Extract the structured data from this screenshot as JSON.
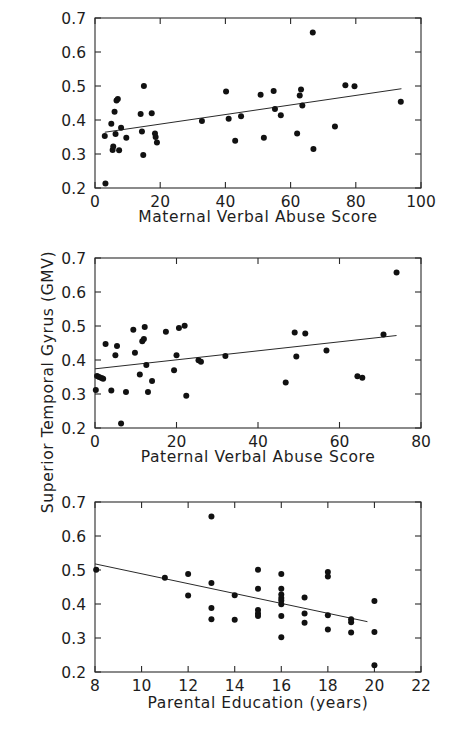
{
  "figure": {
    "y_axis_title": "Superior Temporal Gyrus (GMV)",
    "background_color": "#ffffff",
    "point_color": "#111111",
    "line_color": "#2a2a2a"
  },
  "chart_data": [
    {
      "type": "scatter",
      "panel": "top",
      "title": "",
      "xlabel": "Maternal Verbal Abuse Score",
      "ylabel": "Superior Temporal Gyrus (GMV)",
      "xlim": [
        0,
        100
      ],
      "ylim": [
        0.2,
        0.7
      ],
      "xticks": [
        0,
        20,
        40,
        60,
        80,
        100
      ],
      "xtick_labels": [
        "0",
        "20",
        "40",
        "60",
        "80",
        "100"
      ],
      "yticks": [
        0.2,
        0.3,
        0.4,
        0.5,
        0.6,
        0.7
      ],
      "ytick_labels": [
        "0.2",
        "0.3",
        "0.4",
        "0.5",
        "0.6",
        "0.7"
      ],
      "grid": false,
      "legend": false,
      "points": [
        [
          3.0,
          0.353
        ],
        [
          3.2,
          0.213
        ],
        [
          5.0,
          0.389
        ],
        [
          5.4,
          0.312
        ],
        [
          5.6,
          0.322
        ],
        [
          6.0,
          0.424
        ],
        [
          6.3,
          0.359
        ],
        [
          6.6,
          0.457
        ],
        [
          7.0,
          0.462
        ],
        [
          7.4,
          0.311
        ],
        [
          8.0,
          0.377
        ],
        [
          9.6,
          0.348
        ],
        [
          14.0,
          0.418
        ],
        [
          14.4,
          0.366
        ],
        [
          14.8,
          0.297
        ],
        [
          15.0,
          0.5
        ],
        [
          17.4,
          0.42
        ],
        [
          18.4,
          0.36
        ],
        [
          18.6,
          0.35
        ],
        [
          19.0,
          0.334
        ],
        [
          32.8,
          0.397
        ],
        [
          40.2,
          0.484
        ],
        [
          41.0,
          0.404
        ],
        [
          43.0,
          0.339
        ],
        [
          44.8,
          0.411
        ],
        [
          50.8,
          0.474
        ],
        [
          51.8,
          0.348
        ],
        [
          54.8,
          0.485
        ],
        [
          55.2,
          0.432
        ],
        [
          57.0,
          0.414
        ],
        [
          62.0,
          0.36
        ],
        [
          62.8,
          0.472
        ],
        [
          63.2,
          0.49
        ],
        [
          63.6,
          0.443
        ],
        [
          66.8,
          0.657
        ],
        [
          67.0,
          0.315
        ],
        [
          73.6,
          0.381
        ],
        [
          76.8,
          0.502
        ],
        [
          79.6,
          0.499
        ],
        [
          93.8,
          0.454
        ]
      ],
      "fit_line": {
        "x": [
          3.0,
          94.0
        ],
        "y": [
          0.364,
          0.492
        ]
      }
    },
    {
      "type": "scatter",
      "panel": "middle",
      "title": "",
      "xlabel": "Paternal Verbal Abuse Score",
      "ylabel": "Superior Temporal Gyrus (GMV)",
      "xlim": [
        0,
        80
      ],
      "ylim": [
        0.2,
        0.7
      ],
      "xticks": [
        0,
        20,
        40,
        60,
        80
      ],
      "xtick_labels": [
        "0",
        "20",
        "40",
        "60",
        "80"
      ],
      "yticks": [
        0.2,
        0.3,
        0.4,
        0.5,
        0.6,
        0.7
      ],
      "ytick_labels": [
        "0.2",
        "0.3",
        "0.4",
        "0.5",
        "0.6",
        "0.7"
      ],
      "grid": false,
      "legend": false,
      "points": [
        [
          0.2,
          0.312
        ],
        [
          0.5,
          0.353
        ],
        [
          1.0,
          0.35
        ],
        [
          1.6,
          0.347
        ],
        [
          2.0,
          0.345
        ],
        [
          2.6,
          0.447
        ],
        [
          4.0,
          0.31
        ],
        [
          5.0,
          0.414
        ],
        [
          5.4,
          0.441
        ],
        [
          6.4,
          0.213
        ],
        [
          7.6,
          0.306
        ],
        [
          9.4,
          0.489
        ],
        [
          9.8,
          0.421
        ],
        [
          11.0,
          0.357
        ],
        [
          11.6,
          0.455
        ],
        [
          12.0,
          0.462
        ],
        [
          12.2,
          0.497
        ],
        [
          12.6,
          0.385
        ],
        [
          13.0,
          0.306
        ],
        [
          14.0,
          0.338
        ],
        [
          17.4,
          0.483
        ],
        [
          19.4,
          0.37
        ],
        [
          20.0,
          0.414
        ],
        [
          20.6,
          0.494
        ],
        [
          22.0,
          0.501
        ],
        [
          22.4,
          0.295
        ],
        [
          25.4,
          0.399
        ],
        [
          26.0,
          0.395
        ],
        [
          32.0,
          0.412
        ],
        [
          46.8,
          0.334
        ],
        [
          49.0,
          0.481
        ],
        [
          49.4,
          0.41
        ],
        [
          51.6,
          0.478
        ],
        [
          56.8,
          0.428
        ],
        [
          64.4,
          0.352
        ],
        [
          65.6,
          0.348
        ],
        [
          70.8,
          0.475
        ],
        [
          74.0,
          0.657
        ]
      ],
      "fit_line": {
        "x": [
          0.0,
          74.0
        ],
        "y": [
          0.374,
          0.472
        ]
      }
    },
    {
      "type": "scatter",
      "panel": "bottom",
      "title": "",
      "xlabel": "Parental Education (years)",
      "ylabel": "Superior Temporal Gyrus (GMV)",
      "xlim": [
        8,
        22
      ],
      "ylim": [
        0.2,
        0.7
      ],
      "xticks": [
        8,
        10,
        12,
        14,
        16,
        18,
        20,
        22
      ],
      "xtick_labels": [
        "8",
        "10",
        "12",
        "14",
        "16",
        "18",
        "20",
        "22"
      ],
      "yticks": [
        0.2,
        0.3,
        0.4,
        0.5,
        0.6,
        0.7
      ],
      "ytick_labels": [
        "0.2",
        "0.3",
        "0.4",
        "0.5",
        "0.6",
        "0.7"
      ],
      "grid": false,
      "legend": false,
      "points": [
        [
          8.05,
          0.501
        ],
        [
          11.0,
          0.477
        ],
        [
          12.0,
          0.488
        ],
        [
          12.0,
          0.425
        ],
        [
          13.0,
          0.657
        ],
        [
          13.0,
          0.462
        ],
        [
          13.0,
          0.388
        ],
        [
          13.0,
          0.355
        ],
        [
          14.0,
          0.426
        ],
        [
          14.0,
          0.354
        ],
        [
          15.0,
          0.501
        ],
        [
          15.0,
          0.445
        ],
        [
          15.0,
          0.382
        ],
        [
          15.0,
          0.372
        ],
        [
          15.0,
          0.365
        ],
        [
          16.0,
          0.488
        ],
        [
          16.0,
          0.445
        ],
        [
          16.0,
          0.428
        ],
        [
          16.0,
          0.418
        ],
        [
          16.0,
          0.41
        ],
        [
          16.0,
          0.399
        ],
        [
          16.0,
          0.365
        ],
        [
          16.0,
          0.302
        ],
        [
          17.0,
          0.419
        ],
        [
          17.0,
          0.372
        ],
        [
          17.0,
          0.345
        ],
        [
          18.0,
          0.494
        ],
        [
          18.0,
          0.481
        ],
        [
          18.0,
          0.367
        ],
        [
          18.0,
          0.325
        ],
        [
          19.0,
          0.355
        ],
        [
          19.0,
          0.346
        ],
        [
          19.0,
          0.316
        ],
        [
          20.0,
          0.409
        ],
        [
          20.0,
          0.318
        ],
        [
          20.0,
          0.22
        ]
      ],
      "fit_line": {
        "x": [
          8.0,
          19.7
        ],
        "y": [
          0.518,
          0.348
        ]
      }
    }
  ]
}
